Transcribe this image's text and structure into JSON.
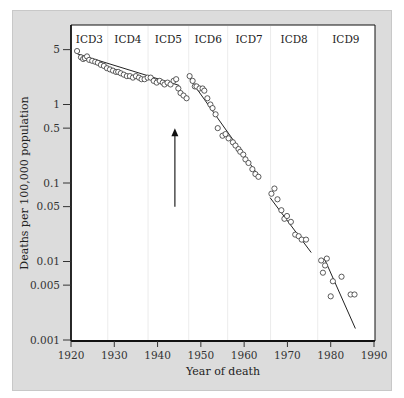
{
  "chart_data": {
    "type": "scatter",
    "title": "",
    "xlabel": "Year of death",
    "ylabel": "Deaths per 100,000 population",
    "xlim": [
      1920,
      1990
    ],
    "ylim": [
      0.001,
      8
    ],
    "yscale": "log",
    "x_ticks": [
      1920,
      1930,
      1940,
      1950,
      1960,
      1970,
      1980,
      1990
    ],
    "y_ticks": [
      {
        "value": 5,
        "label": "5"
      },
      {
        "value": 1,
        "label": "1"
      },
      {
        "value": 0.5,
        "label": "0.5"
      },
      {
        "value": 0.1,
        "label": "0.1"
      },
      {
        "value": 0.05,
        "label": "0.05"
      },
      {
        "value": 0.01,
        "label": "0.01"
      },
      {
        "value": 0.005,
        "label": "0.005"
      },
      {
        "value": 0.001,
        "label": "0.001"
      }
    ],
    "grid": false,
    "icd_periods": [
      {
        "label": "ICD3",
        "start": 1920,
        "end": 1928.5
      },
      {
        "label": "ICD4",
        "start": 1928.5,
        "end": 1937.8
      },
      {
        "label": "ICD5",
        "start": 1937.8,
        "end": 1947.2
      },
      {
        "label": "ICD6",
        "start": 1947.2,
        "end": 1956.2
      },
      {
        "label": "ICD7",
        "start": 1956.2,
        "end": 1966.1
      },
      {
        "label": "ICD8",
        "start": 1966.1,
        "end": 1977
      },
      {
        "label": "ICD9",
        "start": 1977,
        "end": 1990
      }
    ],
    "annotation": {
      "type": "arrow",
      "x": 1944,
      "y_from": 0.05,
      "y_to": 0.5,
      "direction": "up"
    },
    "series": [
      {
        "name": "Observed rate",
        "points": [
          [
            1921.4,
            4.8
          ],
          [
            1922.3,
            4.0
          ],
          [
            1922.8,
            3.8
          ],
          [
            1923.2,
            3.9
          ],
          [
            1923.7,
            4.1
          ],
          [
            1924.2,
            3.7
          ],
          [
            1924.9,
            3.6
          ],
          [
            1925.6,
            3.5
          ],
          [
            1926.2,
            3.4
          ],
          [
            1926.9,
            3.2
          ],
          [
            1927.6,
            3.1
          ],
          [
            1928.3,
            2.9
          ],
          [
            1929.0,
            2.8
          ],
          [
            1929.7,
            2.7
          ],
          [
            1930.4,
            2.6
          ],
          [
            1930.9,
            2.6
          ],
          [
            1931.5,
            2.5
          ],
          [
            1932.2,
            2.4
          ],
          [
            1932.9,
            2.3
          ],
          [
            1933.6,
            2.3
          ],
          [
            1934.3,
            2.2
          ],
          [
            1935.0,
            2.3
          ],
          [
            1935.7,
            2.2
          ],
          [
            1936.3,
            2.1
          ],
          [
            1937.0,
            2.1
          ],
          [
            1937.7,
            2.2
          ],
          [
            1938.4,
            2.2
          ],
          [
            1939.1,
            2.0
          ],
          [
            1939.8,
            1.9
          ],
          [
            1940.5,
            2.0
          ],
          [
            1941.2,
            1.9
          ],
          [
            1941.6,
            1.8
          ],
          [
            1942.3,
            1.9
          ],
          [
            1943.0,
            1.8
          ],
          [
            1943.7,
            2.0
          ],
          [
            1944.3,
            2.1
          ],
          [
            1944.8,
            1.6
          ],
          [
            1945.3,
            1.4
          ],
          [
            1946.0,
            1.3
          ],
          [
            1946.7,
            1.2
          ],
          [
            1947.4,
            2.3
          ],
          [
            1948.1,
            2.0
          ],
          [
            1948.6,
            1.7
          ],
          [
            1949.0,
            1.7
          ],
          [
            1949.7,
            1.6
          ],
          [
            1950.4,
            1.6
          ],
          [
            1950.8,
            1.5
          ],
          [
            1951.5,
            1.2
          ],
          [
            1952.2,
            1.0
          ],
          [
            1952.7,
            0.9
          ],
          [
            1953.4,
            0.75
          ],
          [
            1953.9,
            0.5
          ],
          [
            1955.0,
            0.4
          ],
          [
            1955.7,
            0.42
          ],
          [
            1956.4,
            0.37
          ],
          [
            1957.4,
            0.33
          ],
          [
            1958.0,
            0.3
          ],
          [
            1958.7,
            0.27
          ],
          [
            1959.1,
            0.25
          ],
          [
            1959.8,
            0.23
          ],
          [
            1960.3,
            0.2
          ],
          [
            1961.0,
            0.18
          ],
          [
            1961.9,
            0.15
          ],
          [
            1962.6,
            0.13
          ],
          [
            1963.3,
            0.12
          ],
          [
            1966.3,
            0.073
          ],
          [
            1967.0,
            0.085
          ],
          [
            1967.7,
            0.062
          ],
          [
            1968.6,
            0.045
          ],
          [
            1969.3,
            0.035
          ],
          [
            1969.9,
            0.038
          ],
          [
            1970.8,
            0.032
          ],
          [
            1971.8,
            0.022
          ],
          [
            1972.6,
            0.021
          ],
          [
            1973.3,
            0.019
          ],
          [
            1974.3,
            0.019
          ],
          [
            1977.8,
            0.0103
          ],
          [
            1978.2,
            0.0072
          ],
          [
            1978.7,
            0.0089
          ],
          [
            1979.1,
            0.0109
          ],
          [
            1980.5,
            0.0056
          ],
          [
            1980.0,
            0.0036
          ],
          [
            1982.5,
            0.0064
          ],
          [
            1984.6,
            0.0038
          ],
          [
            1985.5,
            0.0038
          ]
        ]
      }
    ],
    "fit_lines": [
      {
        "segment": "ICD3-ICD5",
        "from": [
          1921.5,
          4.4
        ],
        "to": [
          1945,
          1.75
        ]
      },
      {
        "segment": "ICD6-ICD7",
        "from": [
          1947.5,
          2.1
        ],
        "to": [
          1963.5,
          0.12
        ]
      },
      {
        "segment": "ICD8",
        "from": [
          1966,
          0.065
        ],
        "to": [
          1975.5,
          0.013
        ]
      },
      {
        "segment": "ICD9",
        "from": [
          1978.5,
          0.011
        ],
        "to": [
          1985.7,
          0.0014
        ]
      }
    ]
  }
}
